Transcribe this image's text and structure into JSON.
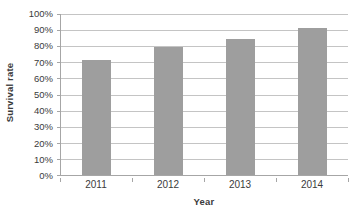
{
  "chart_data": {
    "type": "bar",
    "title": "",
    "subtitle": "",
    "categories": [
      "2011",
      "2012",
      "2013",
      "2014"
    ],
    "values": [
      71,
      79,
      84,
      91
    ],
    "series": [
      {
        "name": "Survival rate",
        "values": [
          71,
          79,
          84,
          91
        ]
      }
    ],
    "xlabel": "Year",
    "ylabel": "Survival rate",
    "ylim": [
      0,
      100
    ],
    "ytick_step": 10,
    "ytick_labels": [
      "0%",
      "10%",
      "20%",
      "30%",
      "40%",
      "50%",
      "60%",
      "70%",
      "80%",
      "90%",
      "100%"
    ],
    "ytick_values": [
      0,
      10,
      20,
      30,
      40,
      50,
      60,
      70,
      80,
      90,
      100
    ],
    "value_suffix": "%",
    "grid": true,
    "grid_axis": "y",
    "legend": false,
    "legend_position": "none",
    "annotations": [],
    "colors": {
      "bar": "#9e9e9e",
      "gridline": "#c4c4c4",
      "axis": "#a6a6a6",
      "text": "#3b3b3b",
      "background": "#ffffff"
    }
  }
}
